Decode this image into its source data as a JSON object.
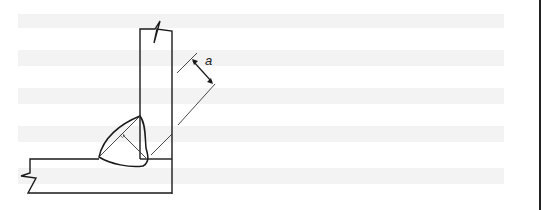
{
  "diagram": {
    "dimension_label": "a",
    "colors": {
      "background": "#ffffff",
      "stripe": "#f2f2f2",
      "line": "#1a1a1a",
      "thin_line": "#333333"
    },
    "elements": [
      "vertical-plate",
      "horizontal-plate",
      "weld-bead",
      "throat-line",
      "dimension-arrow"
    ]
  }
}
